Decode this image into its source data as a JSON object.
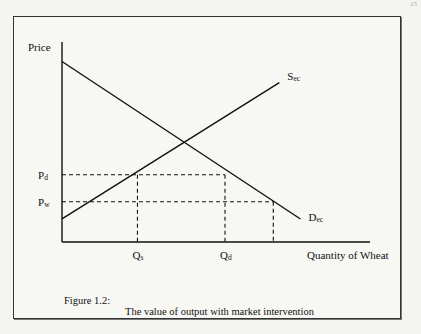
{
  "page_number": "15",
  "figure": {
    "number_label": "Figure 1.2:",
    "title": "The value of output with market intervention"
  },
  "chart_data": {
    "type": "line",
    "title": "The value of output with market intervention",
    "xlabel": "Quantity of Wheat",
    "ylabel": "Price",
    "xlim": [
      0,
      10
    ],
    "ylim": [
      0,
      10
    ],
    "grid": false,
    "legend": "none",
    "series": [
      {
        "name": "Demand",
        "label": "Dec",
        "x": [
          0,
          7.9
        ],
        "y": [
          9.4,
          1.2
        ]
      },
      {
        "name": "Supply",
        "label": "Sec",
        "x": [
          0,
          7.2
        ],
        "y": [
          1.2,
          8.3
        ]
      }
    ],
    "reference_lines": {
      "horizontal": [
        {
          "label": "Pd",
          "y": 3.5,
          "x_end": 5.4
        },
        {
          "label": "Pw",
          "y": 2.1,
          "x_end": 7.0
        }
      ],
      "vertical": [
        {
          "label": "Qs",
          "x": 2.5,
          "y_end": 3.5
        },
        {
          "label": "Qd",
          "x": 5.4,
          "y_end": 3.5
        },
        {
          "label": "",
          "x": 7.0,
          "y_end": 2.1
        }
      ]
    },
    "tick_labels": {
      "y": [
        {
          "main": "P",
          "sub": "d"
        },
        {
          "main": "P",
          "sub": "w"
        }
      ],
      "x": [
        {
          "main": "Q",
          "sub": "s"
        },
        {
          "main": "Q",
          "sub": "d"
        }
      ]
    },
    "curve_labels": [
      {
        "main": "S",
        "sub": "ec"
      },
      {
        "main": "D",
        "sub": "ec"
      }
    ]
  }
}
